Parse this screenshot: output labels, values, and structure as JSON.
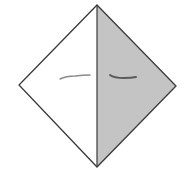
{
  "diagram": {
    "type": "origami-fold-diagram",
    "shape": "square-rotated-diamond",
    "vertices": {
      "top": [
        97,
        5
      ],
      "left": [
        19,
        85
      ],
      "right": [
        176,
        86
      ],
      "bottom": [
        97,
        167
      ]
    },
    "center_crease": {
      "from": [
        97,
        5
      ],
      "to": [
        97,
        167
      ]
    },
    "colors": {
      "background": "#ffffff",
      "outline": "#3a3a3a",
      "left_face": "#ffffff",
      "right_face": "#c4c4c4",
      "left_mark": "#8a8a8a",
      "right_mark": "#5a5a5a"
    },
    "marks": [
      {
        "side": "left",
        "path": "M60 79 Q66 76 75 76 Q83 75 90 75"
      },
      {
        "side": "right",
        "path": "M110 75 Q114 78 124 78 Q131 78 136 77"
      }
    ]
  }
}
